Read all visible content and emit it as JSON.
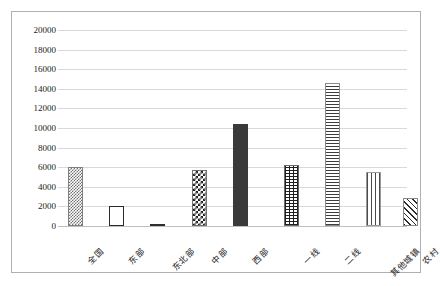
{
  "chart_data": {
    "type": "bar",
    "title": "",
    "subtitle": "",
    "xlabel": "",
    "ylabel": "",
    "ylim": [
      0,
      20000
    ],
    "ytick_step": 2000,
    "grid": true,
    "legend": "none",
    "categories": [
      "全国",
      "东部",
      "东北部",
      "中部",
      "西部",
      "一线",
      "二线",
      "其他城镇",
      "农村"
    ],
    "values": [
      6000,
      2050,
      230,
      5700,
      10400,
      6250,
      14600,
      5500,
      2900
    ],
    "ytick_labels": [
      "0",
      "2000",
      "4000",
      "6000",
      "8000",
      "10000",
      "12000",
      "14000",
      "16000",
      "18000",
      "20000"
    ],
    "ytick_values": [
      0,
      2000,
      4000,
      6000,
      8000,
      10000,
      12000,
      14000,
      16000,
      18000,
      20000
    ],
    "bars": [
      {
        "label": "全国",
        "value": 6000,
        "pattern": "fine-checker",
        "pattern_class": "pat-fine-check",
        "group": "region"
      },
      {
        "label": "东部",
        "value": 2050,
        "pattern": "hollow-outline",
        "pattern_class": "pat-hollow",
        "group": "region"
      },
      {
        "label": "东北部",
        "value": 230,
        "pattern": "solid-dark",
        "pattern_class": "pat-solid-dark",
        "group": "region"
      },
      {
        "label": "中部",
        "value": 5700,
        "pattern": "coarse-checker",
        "pattern_class": "pat-coarse-check",
        "group": "region"
      },
      {
        "label": "西部",
        "value": 10400,
        "pattern": "solid-dark",
        "pattern_class": "pat-solid-darkgray",
        "group": "region"
      },
      {
        "label": "一线",
        "value": 6250,
        "pattern": "grid-crosshatch",
        "pattern_class": "pat-grid",
        "group": "tier"
      },
      {
        "label": "二线",
        "value": 14600,
        "pattern": "horizontal-lines",
        "pattern_class": "pat-hlines",
        "group": "tier"
      },
      {
        "label": "其他城镇",
        "value": 5500,
        "pattern": "vertical-lines",
        "pattern_class": "pat-vlines",
        "group": "tier"
      },
      {
        "label": "农村",
        "value": 2900,
        "pattern": "diagonal-hatch",
        "pattern_class": "pat-diag",
        "group": "tier"
      }
    ],
    "colors": {
      "gridline": "#d9d9d9",
      "axis": "#bfbfbf",
      "text": "#222222",
      "frame": "#b0b0b0",
      "background": "#ffffff"
    }
  }
}
